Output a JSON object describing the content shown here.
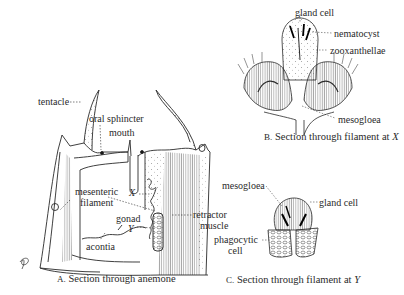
{
  "figures": {
    "a": {
      "caption_prefix": "A.",
      "caption": "Section through anemone",
      "labels": {
        "tentacle": "tentacle",
        "oral_sphincter": "oral sphincter",
        "mouth": "mouth",
        "mesenteric": "mesenteric",
        "filament": "filament",
        "x": "X",
        "gonad": "gonad",
        "y": "Y",
        "acontia": "acontia",
        "retractor": "retractor",
        "muscle": "muscle"
      }
    },
    "b": {
      "caption_prefix": "B.",
      "caption": "Section through filament at",
      "caption_var": "X",
      "labels": {
        "gland_cell": "gland cell",
        "nematocyst": "nematocyst",
        "zooxanthellae": "zooxanthellae",
        "mesogloea": "mesogloea"
      }
    },
    "c": {
      "caption_prefix": "C.",
      "caption": "Section through filament at",
      "caption_var": "Y",
      "labels": {
        "mesogloea": "mesogloea",
        "gland_cell": "gland cell",
        "phagocytic": "phagocytic",
        "cell": "cell"
      }
    }
  },
  "colors": {
    "ink": "#2a2a2a",
    "background": "#ffffff"
  }
}
